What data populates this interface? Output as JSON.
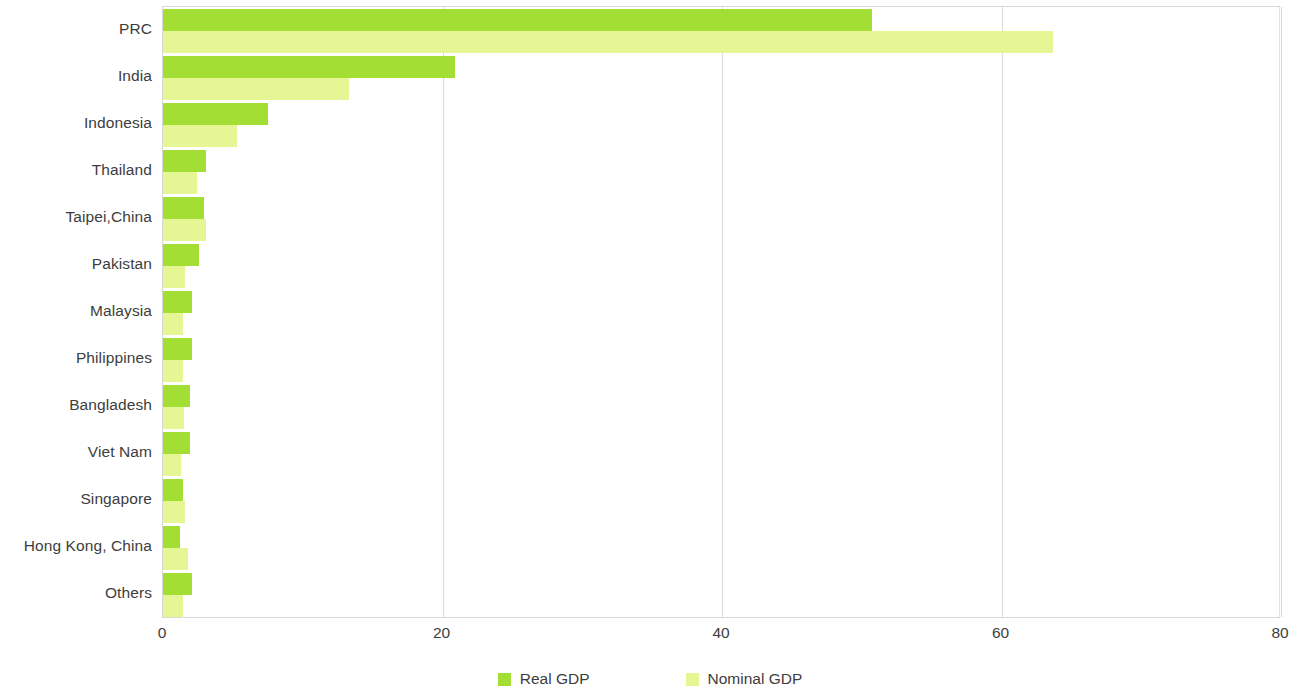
{
  "chart_data": {
    "type": "bar",
    "orientation": "horizontal",
    "title": "",
    "subtitle": "",
    "xlabel": "",
    "ylabel": "",
    "xlim": [
      0,
      80
    ],
    "ylim": null,
    "xticks": [
      "0",
      "20",
      "40",
      "60",
      "80"
    ],
    "xtick_values": [
      0,
      20,
      40,
      60,
      80
    ],
    "grid": true,
    "grid_axis": "x",
    "legend_position": "bottom-center",
    "categories": [
      "PRC",
      "India",
      "Indonesia",
      "Thailand",
      "Taipei,China",
      "Pakistan",
      "Malaysia",
      "Philippines",
      "Bangladesh",
      "Viet Nam",
      "Singapore",
      "Hong Kong, China",
      "Others"
    ],
    "series": [
      {
        "name": "Real GDP",
        "color": "#a3de35",
        "values": [
          50.7,
          20.9,
          7.5,
          3.1,
          2.9,
          2.6,
          2.1,
          2.1,
          1.9,
          1.9,
          1.4,
          1.2,
          2.1
        ]
      },
      {
        "name": "Nominal GDP",
        "color": "#e7f694",
        "values": [
          63.7,
          13.3,
          5.3,
          2.4,
          3.1,
          1.6,
          1.4,
          1.4,
          1.5,
          1.3,
          1.6,
          1.8,
          1.4
        ]
      }
    ]
  },
  "legend": {
    "items": [
      {
        "label": "Real GDP",
        "color": "#a3de35"
      },
      {
        "label": "Nominal GDP",
        "color": "#e7f694"
      }
    ]
  },
  "colors": {
    "real_gdp": "#a3de35",
    "nominal_gdp": "#e7f694",
    "gridline": "#d9d9d9",
    "text": "#3d3d3d",
    "background": "#ffffff"
  }
}
